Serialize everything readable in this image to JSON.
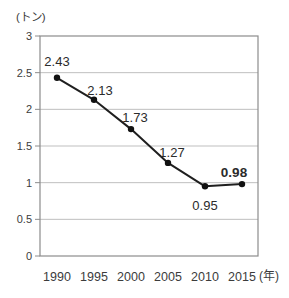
{
  "chart_data": {
    "type": "line",
    "title": "",
    "y_unit": "(トン)",
    "x_unit": "(年)",
    "categories": [
      "1990",
      "1995",
      "2000",
      "2005",
      "2010",
      "2015"
    ],
    "values": [
      2.43,
      2.13,
      1.73,
      1.27,
      0.95,
      0.98
    ],
    "point_labels": [
      "2.43",
      "2.13",
      "1.73",
      "1.27",
      "0.95",
      "0.98"
    ],
    "label_positions": [
      "above",
      "above",
      "above",
      "above",
      "below",
      "above"
    ],
    "emphasized_point": "0.98",
    "ylim": [
      0,
      3
    ],
    "ytick_labels": [
      "0",
      "0.5",
      "1",
      "1.5",
      "2",
      "2.5",
      "3"
    ],
    "grid": true,
    "legend": "none",
    "colors": {
      "line": "#1f1f1f",
      "marker": "#111111",
      "grid": "#bfbfbf",
      "frame": "#8c8c8c",
      "text": "#3c3c3c",
      "point_label_text": "#2b2b2b"
    }
  }
}
